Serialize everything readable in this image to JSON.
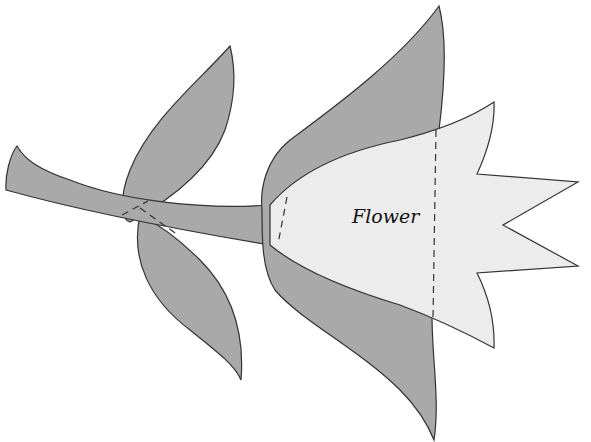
{
  "diagram": {
    "title": "Flower",
    "label": "Flower",
    "colors": {
      "sepal": "#a9a9a9",
      "petal": "#ececec",
      "stroke": "#333333",
      "background": "#ffffff"
    }
  }
}
